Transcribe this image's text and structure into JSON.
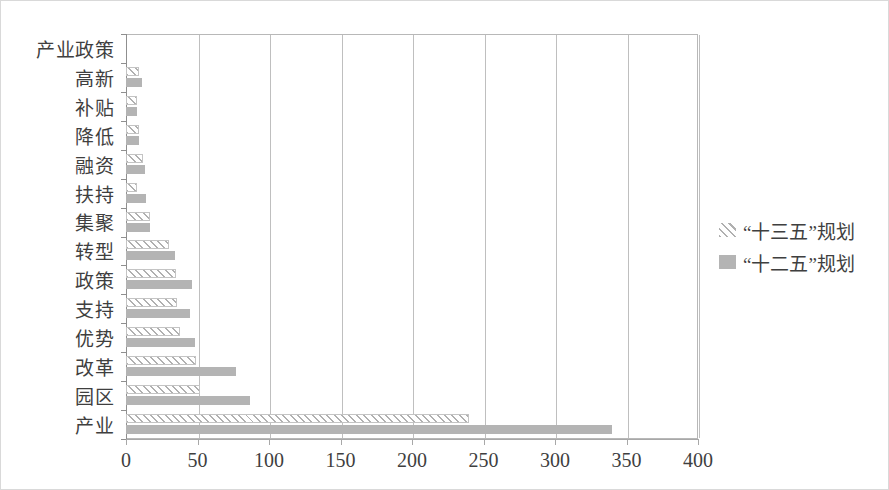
{
  "chart_data": {
    "type": "bar",
    "orientation": "horizontal",
    "title": "",
    "xlabel": "",
    "ylabel": "",
    "xlim": [
      0,
      400
    ],
    "xticks": [
      0,
      50,
      100,
      150,
      200,
      250,
      300,
      350,
      400
    ],
    "grid": true,
    "legend_position": "right",
    "categories": [
      "产业政策",
      "高新",
      "补贴",
      "降低",
      "融资",
      "扶持",
      "集聚",
      "转型",
      "政策",
      "支持",
      "优势",
      "改革",
      "园区",
      "产业"
    ],
    "series": [
      {
        "name": "“十三五”规划",
        "pattern": "hatch",
        "color": "#b0b0b0",
        "values": [
          0,
          9,
          8,
          9,
          12,
          8,
          17,
          30,
          35,
          36,
          38,
          49,
          52,
          240
        ]
      },
      {
        "name": "“十二五”规划",
        "pattern": "solid",
        "color": "#b4b4b4",
        "values": [
          0,
          11,
          8,
          9,
          13,
          14,
          17,
          34,
          46,
          45,
          48,
          77,
          87,
          340
        ]
      }
    ]
  },
  "legend": {
    "items": [
      {
        "label": "“十三五”规划",
        "swatch": "hatch"
      },
      {
        "label": "“十二五”规划",
        "swatch": "solid"
      }
    ]
  },
  "axis": {
    "x_tick_labels": [
      "0",
      "50",
      "100",
      "150",
      "200",
      "250",
      "300",
      "350",
      "400"
    ]
  }
}
